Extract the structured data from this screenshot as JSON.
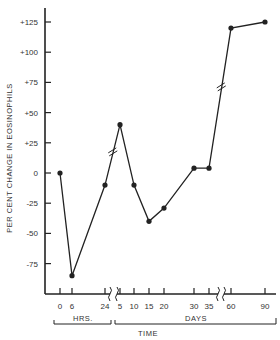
{
  "chart_data": {
    "type": "line",
    "title": "",
    "xlabel": "TIME",
    "ylabel": "PER CENT  CHANGE IN EOSINOPHILS",
    "ylim": [
      -100,
      135
    ],
    "yticks": [
      125,
      100,
      75,
      50,
      25,
      0,
      -25,
      -50,
      -75
    ],
    "ytick_labels": [
      "+125",
      "+100",
      "+75",
      "+50",
      "+25",
      "0",
      "-25",
      "-50",
      "-75"
    ],
    "x_groups": [
      {
        "label": "HRS.",
        "ticks": [
          "0",
          "6",
          "24"
        ]
      },
      {
        "label": "DAYS",
        "ticks": [
          "5",
          "10",
          "15",
          "20",
          "30",
          "35",
          "60",
          "90"
        ]
      }
    ],
    "axis_breaks": [
      "between 24 hrs and 5 days",
      "between 35 and 60 days"
    ],
    "series": [
      {
        "name": "Eosinophil change",
        "x": [
          "0 hrs",
          "6 hrs",
          "24 hrs",
          "5 days",
          "10 days",
          "15 days",
          "20 days",
          "30 days",
          "35 days",
          "60 days",
          "90 days"
        ],
        "values": [
          0,
          -85,
          -10,
          40,
          -10,
          -40,
          -29,
          4,
          4,
          120,
          125
        ]
      }
    ],
    "grid": false,
    "legend": "none"
  },
  "labels": {
    "ylabel": "PER CENT  CHANGE IN EOSINOPHILS",
    "hrs": "HRS.",
    "days": "DAYS",
    "time": "TIME"
  }
}
